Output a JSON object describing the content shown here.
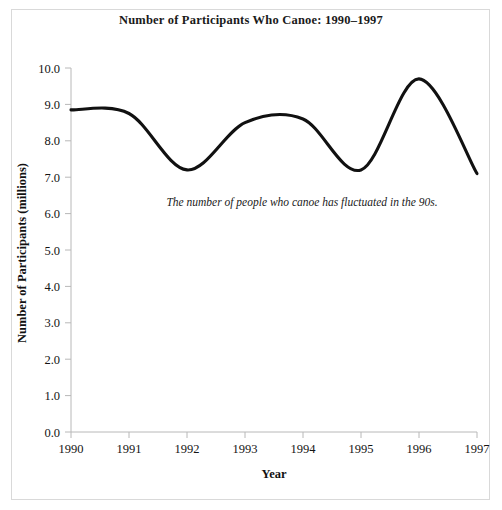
{
  "chart_data": {
    "type": "line",
    "title": "Number of Participants Who Canoe: 1990–1997",
    "xlabel": "Year",
    "ylabel": "Number of Participants (millions)",
    "categories": [
      "1990",
      "1991",
      "1992",
      "1993",
      "1994",
      "1995",
      "1996",
      "1997"
    ],
    "x": [
      1990,
      1991,
      1992,
      1993,
      1994,
      1995,
      1996,
      1997
    ],
    "values": [
      8.85,
      8.75,
      7.2,
      8.5,
      8.6,
      7.2,
      9.7,
      7.1
    ],
    "series": [
      {
        "name": "Participants who canoe",
        "values": [
          8.85,
          8.75,
          7.2,
          8.5,
          8.6,
          7.2,
          9.7,
          7.1
        ]
      }
    ],
    "xlim": [
      1990,
      1997
    ],
    "ylim": [
      0.0,
      10.0
    ],
    "ytick_labels": [
      "0.0",
      "1.0",
      "2.0",
      "3.0",
      "4.0",
      "5.0",
      "6.0",
      "7.0",
      "8.0",
      "9.0",
      "10.0"
    ],
    "ytick_values": [
      0,
      1,
      2,
      3,
      4,
      5,
      6,
      7,
      8,
      9,
      10
    ],
    "xtick_labels": [
      "1990",
      "1991",
      "1992",
      "1993",
      "1994",
      "1995",
      "1996",
      "1997"
    ],
    "grid": false,
    "legend": false,
    "line_color": "#111111",
    "annotations": [
      {
        "text": "The number of people who canoe has fluctuated in the 90s.",
        "x": 1992.6,
        "y": 6.25,
        "style": "italic"
      }
    ]
  },
  "figure": {
    "background_color": "#ffffff",
    "border_color": "#d9d9d9",
    "axis_color": "#b8b8b8"
  }
}
